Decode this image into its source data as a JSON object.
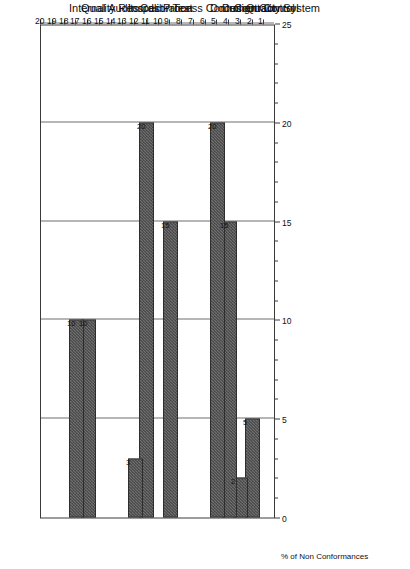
{
  "chart_data": {
    "type": "bar",
    "orientation": "horizontal",
    "title": "",
    "xlabel": "% of Non Conformances",
    "ylabel": "ISO 9001 Clauses",
    "xlim": [
      0,
      25
    ],
    "ylim": [
      0,
      20
    ],
    "grid": true,
    "legend": false,
    "value_axis_ticks": [
      "0",
      "5",
      "10",
      "15",
      "20",
      "25"
    ],
    "value_axis_tick_values": [
      0,
      5,
      10,
      15,
      20,
      25
    ],
    "value_axis_minor_step": 1,
    "category_axis_ticks": [
      "1",
      "2",
      "3",
      "4",
      "5",
      "6",
      "7",
      "8",
      "9",
      "10",
      "11",
      "12",
      "13",
      "14",
      "15",
      "16",
      "17",
      "18",
      "19",
      "20"
    ],
    "category_axis_tick_values": [
      1,
      2,
      3,
      4,
      5,
      6,
      7,
      8,
      9,
      10,
      11,
      12,
      13,
      14,
      15,
      16,
      17,
      18,
      19,
      20
    ],
    "categories": [
      2,
      3,
      4,
      5,
      9,
      11,
      12,
      16,
      17
    ],
    "category_labels": [
      "Quality System",
      "Contract",
      "Design Control",
      "Document Control",
      "Process Control",
      "Calibration",
      "Inspect / Test",
      "Quality Records",
      "Internal Audits"
    ],
    "values": [
      5,
      2,
      15,
      20,
      15,
      20,
      3,
      10,
      10
    ],
    "data_labels": [
      "5",
      "2",
      "15",
      "20",
      "15",
      "20",
      "3",
      "10",
      "10"
    ],
    "bars": [
      {
        "clause": 2,
        "label": "Quality System",
        "value": 5,
        "data_label": "5"
      },
      {
        "clause": 3,
        "label": "Contract",
        "value": 2,
        "data_label": "2"
      },
      {
        "clause": 4,
        "label": "Design Control",
        "value": 15,
        "data_label": "15"
      },
      {
        "clause": 5,
        "label": "Document Control",
        "value": 20,
        "data_label": "20"
      },
      {
        "clause": 9,
        "label": "Process Control",
        "value": 15,
        "data_label": "15"
      },
      {
        "clause": 11,
        "label": "Calibration",
        "value": 20,
        "data_label": "20"
      },
      {
        "clause": 12,
        "label": "Inspect / Test",
        "value": 3,
        "data_label": "3"
      },
      {
        "clause": 16,
        "label": "Quality Records",
        "value": 10,
        "data_label": "10"
      },
      {
        "clause": 17,
        "label": "Internal Audits",
        "value": 10,
        "data_label": "10"
      }
    ],
    "colors": {
      "bar_fill": "#6f6f6f",
      "bar_fill_dither": "#3b3b3b",
      "bar_edge": "#2e2e2e",
      "axis": "#3a3a3a",
      "grid": "#6e6e6e",
      "text": "#111111",
      "background": "#ffffff"
    }
  }
}
